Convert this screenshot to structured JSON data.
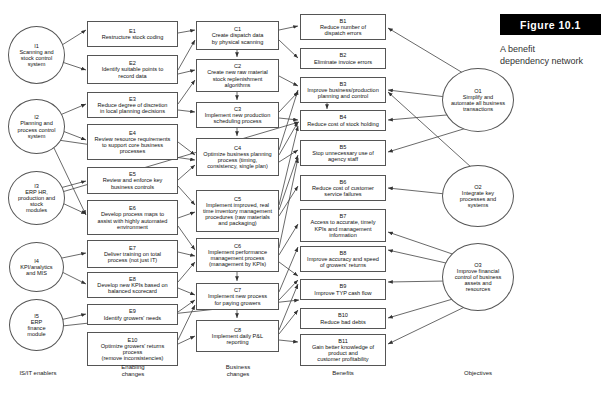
{
  "figure": {
    "tag": "Figure  10.1",
    "caption_line1": "A benefit",
    "caption_line2": "dependency network"
  },
  "column_labels": [
    {
      "id": "col-is-it-enablers",
      "line1": "IS/IT enablers",
      "line2": ""
    },
    {
      "id": "col-enabling-changes",
      "line1": "Enabling",
      "line2": "changes"
    },
    {
      "id": "col-business-changes",
      "line1": "Business",
      "line2": "changes"
    },
    {
      "id": "col-benefits",
      "line1": "Benefits",
      "line2": ""
    },
    {
      "id": "col-objectives",
      "line1": "Objectives",
      "line2": ""
    }
  ],
  "enablers": [
    {
      "id": "I1",
      "lines": [
        "Scanning and",
        "stock control",
        "system"
      ]
    },
    {
      "id": "I2",
      "lines": [
        "Planning and",
        "process control",
        "system"
      ]
    },
    {
      "id": "I3",
      "lines": [
        "ERP HR,",
        "production and",
        "stock",
        "modules"
      ]
    },
    {
      "id": "I4",
      "lines": [
        "KPI/analytics",
        "and MIS"
      ]
    },
    {
      "id": "I5",
      "lines": [
        "ERP",
        "finance",
        "module"
      ]
    }
  ],
  "enabling_changes": [
    {
      "id": "E1",
      "lines": [
        "Restructure stock coding"
      ]
    },
    {
      "id": "E2",
      "lines": [
        "Identify suitable points to",
        "record data"
      ]
    },
    {
      "id": "E3",
      "lines": [
        "Reduce degree of discretion",
        "in local planning decisions"
      ]
    },
    {
      "id": "E4",
      "lines": [
        "Review resource requirements",
        "to support core business",
        "processes"
      ]
    },
    {
      "id": "E5",
      "lines": [
        "Review and enforce key",
        "business controls"
      ]
    },
    {
      "id": "E6",
      "lines": [
        "Develop process maps to",
        "assist with highly automated",
        "environment"
      ]
    },
    {
      "id": "E7",
      "lines": [
        "Deliver training on total",
        "process (not just IT)"
      ]
    },
    {
      "id": "E8",
      "lines": [
        "Develop new KPIs based on",
        "balanced scorecard"
      ]
    },
    {
      "id": "E9",
      "lines": [
        "Identify growers' needs"
      ]
    },
    {
      "id": "E10",
      "lines": [
        "Optimize growers' returns",
        "process",
        "(remove inconsistencies)"
      ]
    }
  ],
  "business_changes": [
    {
      "id": "C1",
      "lines": [
        "Create dispatch data",
        "by physical scanning"
      ]
    },
    {
      "id": "C2",
      "lines": [
        "Create new raw material",
        "stock replenishment",
        "algorithms"
      ]
    },
    {
      "id": "C3",
      "lines": [
        "Implement new production",
        "scheduling process"
      ]
    },
    {
      "id": "C4",
      "lines": [
        "Optimize business planning",
        "process (timing,",
        "consistency, single plan)"
      ]
    },
    {
      "id": "C5",
      "lines": [
        "Implement improved, real",
        "time inventory management",
        "procedures (raw materials",
        "and packaging)"
      ]
    },
    {
      "id": "C6",
      "lines": [
        "Implement performance",
        "management process",
        "(management by KPIs)"
      ]
    },
    {
      "id": "C7",
      "lines": [
        "Implement new process",
        "for paying growers"
      ]
    },
    {
      "id": "C8",
      "lines": [
        "Implement daily P&L",
        "reporting"
      ]
    }
  ],
  "benefits": [
    {
      "id": "B1",
      "lines": [
        "Reduce number of",
        "dispatch errors"
      ]
    },
    {
      "id": "B2",
      "lines": [
        "Eliminate invoice errors"
      ]
    },
    {
      "id": "B3",
      "lines": [
        "Improve business/production",
        "planning and control"
      ]
    },
    {
      "id": "B4",
      "lines": [
        "Reduce cost of stock holding"
      ]
    },
    {
      "id": "B5",
      "lines": [
        "Stop unnecessary use of",
        "agency staff"
      ]
    },
    {
      "id": "B6",
      "lines": [
        "Reduce cost of customer",
        "service failures"
      ]
    },
    {
      "id": "B7",
      "lines": [
        "Access to accurate, timely",
        "KPIs and management",
        "information"
      ]
    },
    {
      "id": "B8",
      "lines": [
        "Improve accuracy and speed",
        "of growers' returns"
      ]
    },
    {
      "id": "B9",
      "lines": [
        "Improve TYP cash flow"
      ]
    },
    {
      "id": "B10",
      "lines": [
        "Reduce bad debts"
      ]
    },
    {
      "id": "B11",
      "lines": [
        "Gain better knowledge of",
        "product and",
        "customer profitability"
      ]
    }
  ],
  "objectives": [
    {
      "id": "O1",
      "lines": [
        "Simplify and",
        "automate all business",
        "transactions"
      ]
    },
    {
      "id": "O2",
      "lines": [
        "Integrate key",
        "processes and",
        "systems"
      ]
    },
    {
      "id": "O3",
      "lines": [
        "Improve financial",
        "control of business",
        "assets and",
        "resources"
      ]
    }
  ],
  "colors": {
    "stroke": "#555555",
    "background": "#ffffff",
    "text": "#111111",
    "figure_tag_bg": "#000000",
    "figure_tag_text": "#ffffff"
  }
}
